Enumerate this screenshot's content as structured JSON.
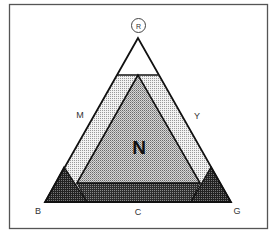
{
  "diagram": {
    "top_label": "R",
    "center_label": "N",
    "left_side_label": "M",
    "right_side_label": "Y",
    "bottom_left_label": "B",
    "bottom_center_label": "C",
    "bottom_right_label": "G"
  },
  "colors": {
    "frame": "#555555",
    "stroke": "#111111",
    "white_cap": "#ffffff",
    "light_band": "#e4e4e4",
    "inner_triangle": "#bdbdbd",
    "dark_band": "#4a4a4a",
    "corner_triangles": "#3a3a3a"
  }
}
